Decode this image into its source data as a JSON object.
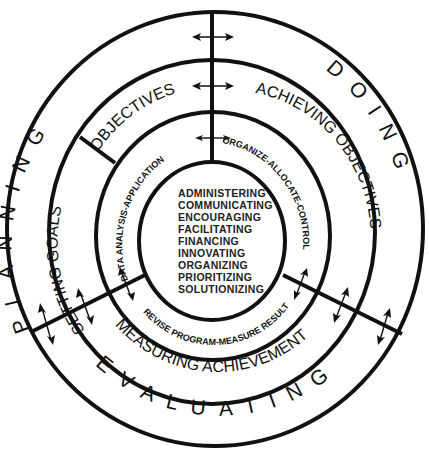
{
  "diagram": {
    "outer_ring": {
      "planning": "PLANNING",
      "doing": "DOING",
      "evaluating": "EVALUATING"
    },
    "middle_ring": {
      "setting_goals": "SETTING GOALS",
      "objectives": "OBJECTIVES",
      "achieving_objectives": "ACHIEVING OBJECTIVES",
      "measuring_achievement": "MEASURING ACHIEVEMENT"
    },
    "inner_ring": {
      "data_analysis": "DATA ANALYSIS-APPLICATION",
      "organize": "ORGANIZE-ALLOCATE-CONTROL",
      "revise": "REVISE PROGRAM-MEASURE RESULTS"
    },
    "core": {
      "items": [
        "ADMINISTERING",
        "COMMUNICATING",
        "ENCOURAGING",
        "FACILITATING",
        "FINANCING",
        "INNOVATING",
        "ORGANIZING",
        "PRIORITIZING",
        "SOLUTIONIZING"
      ]
    },
    "colors": {
      "line": "#111111",
      "background": "#ffffff"
    }
  }
}
